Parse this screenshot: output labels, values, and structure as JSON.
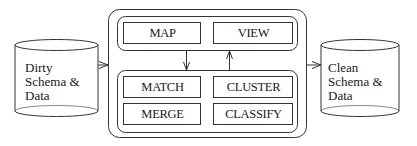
{
  "diagram": {
    "source": {
      "lines": [
        "Dirty",
        "Schema &",
        "Data"
      ]
    },
    "target": {
      "lines": [
        "Clean",
        "Schema &",
        "Data"
      ]
    },
    "top_group": {
      "boxes": [
        "MAP",
        "VIEW"
      ]
    },
    "bottom_group": {
      "boxes": [
        "MATCH",
        "CLUSTER",
        "MERGE",
        "CLASSIFY"
      ]
    },
    "colors": {
      "stroke": "#333333",
      "background": "#ffffff"
    }
  }
}
